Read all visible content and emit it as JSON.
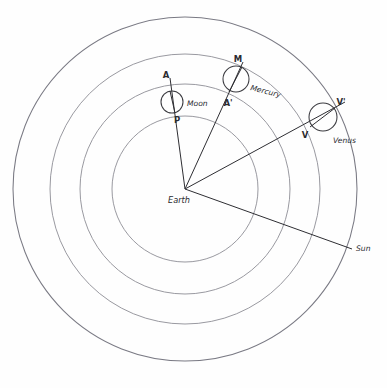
{
  "figure": {
    "center_label": "Earth",
    "background_color": "#fefefe",
    "ink_color": "#2e2e33",
    "orbit_color": "#8d8d95"
  },
  "center": {
    "x": 185,
    "y": 189
  },
  "orbits": [
    {
      "name": "moon-orbit",
      "radius": 73,
      "label": ""
    },
    {
      "name": "mercury-orbit",
      "radius": 105,
      "label": ""
    },
    {
      "name": "venus-orbit",
      "radius": 135,
      "label": ""
    },
    {
      "name": "sun-orbit",
      "radius": 172,
      "label": ""
    }
  ],
  "bodies": [
    {
      "name": "moon",
      "label": "Moon",
      "label_x": 187,
      "label_y": 106,
      "circle": {
        "cx": 172,
        "cy": 102,
        "r": 11
      },
      "apsis_far": {
        "label": "A",
        "x": 166,
        "y": 78,
        "px": 170,
        "py": 91
      },
      "apsis_near": {
        "label": "P",
        "x": 177,
        "y": 123,
        "px": 175,
        "py": 113
      }
    },
    {
      "name": "mercury",
      "label": "Mercury",
      "label_x": 250,
      "label_y": 90,
      "circle": {
        "cx": 236,
        "cy": 79,
        "r": 13
      },
      "apsis_far": {
        "label": "M",
        "x": 238,
        "y": 62,
        "px": 242,
        "py": 67
      },
      "apsis_near": {
        "label": "A'",
        "x": 228,
        "y": 106,
        "px": 230,
        "py": 91
      }
    },
    {
      "name": "venus",
      "label": "Venus",
      "label_x": 333,
      "label_y": 143,
      "circle": {
        "cx": 323,
        "cy": 117,
        "r": 14
      },
      "apsis_far": {
        "label": "V'",
        "x": 341,
        "y": 105,
        "px": 335,
        "py": 108
      },
      "apsis_near": {
        "label": "V",
        "x": 305,
        "y": 138,
        "px": 311,
        "py": 126
      }
    }
  ],
  "rays": [
    {
      "name": "ray-to-moon",
      "x2": 170,
      "y2": 78
    },
    {
      "name": "ray-to-mercury",
      "x2": 243,
      "y2": 62
    },
    {
      "name": "ray-to-venus",
      "x2": 345,
      "y2": 102
    },
    {
      "name": "ray-to-sun",
      "x2": 352,
      "y2": 249
    }
  ],
  "sun": {
    "label": "Sun",
    "label_x": 356,
    "label_y": 251
  }
}
